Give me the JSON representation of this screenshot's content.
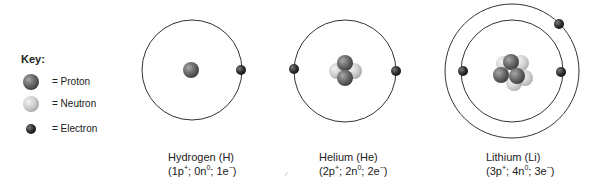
{
  "key": {
    "title": "Key:",
    "items": [
      {
        "particle": "proton",
        "label": "= Proton",
        "color": "#6b6b6b"
      },
      {
        "particle": "neutron",
        "label": "= Neutron",
        "color": "#cfcfcf"
      },
      {
        "particle": "electron",
        "label": "= Electron",
        "color": "#2f2f2f"
      }
    ]
  },
  "atoms": [
    {
      "name": "Hydrogen (H)",
      "composition": {
        "protons": "1p",
        "neutrons": "0n",
        "electrons": "1e"
      },
      "shells": 1,
      "electron_count": 1
    },
    {
      "name": "Helium (He)",
      "composition": {
        "protons": "2p",
        "neutrons": "2n",
        "electrons": "2e"
      },
      "shells": 1,
      "electron_count": 2
    },
    {
      "name": "Lithium (Li)",
      "composition": {
        "protons": "3p",
        "neutrons": "4n",
        "electrons": "3e"
      },
      "shells": 2,
      "electron_count": 3
    }
  ],
  "symbols": {
    "plus": "+",
    "zero": "0",
    "minus": "−",
    "sep": "; ",
    "open": "(",
    "close": ")"
  }
}
